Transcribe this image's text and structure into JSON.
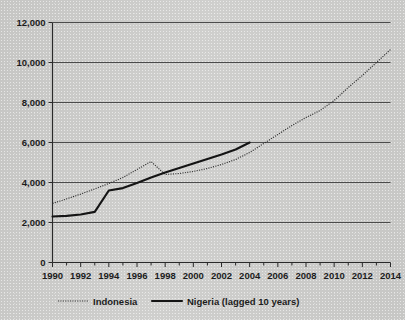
{
  "chart_data": {
    "type": "line",
    "title": "",
    "xlabel": "",
    "ylabel": "",
    "xlim": [
      1990,
      2014
    ],
    "ylim": [
      0,
      12000
    ],
    "grid": true,
    "legend_position": "bottom",
    "y_ticks": [
      "0",
      "2,000",
      "4,000",
      "6,000",
      "8,000",
      "10,000",
      "12,000"
    ],
    "y_tick_values": [
      0,
      2000,
      4000,
      6000,
      8000,
      10000,
      12000
    ],
    "x_ticks": [
      "1990",
      "1992",
      "1994",
      "1996",
      "1998",
      "2000",
      "2002",
      "2004",
      "2006",
      "2008",
      "2010",
      "2012",
      "2014"
    ],
    "x_tick_values": [
      1990,
      1992,
      1994,
      1996,
      1998,
      2000,
      2002,
      2004,
      2006,
      2008,
      2010,
      2012,
      2014
    ],
    "x_minor_ticks": [
      1991,
      1993,
      1995,
      1997,
      1999,
      2001,
      2003,
      2005,
      2007,
      2009,
      2011,
      2013
    ],
    "series": [
      {
        "name": "Indonesia",
        "style": "dotted",
        "color": "#2e2e2e",
        "x": [
          1990,
          1991,
          1992,
          1993,
          1994,
          1995,
          1996,
          1997,
          1998,
          1999,
          2000,
          2001,
          2002,
          2003,
          2004,
          2005,
          2006,
          2007,
          2008,
          2009,
          2010,
          2011,
          2012,
          2013,
          2014
        ],
        "values": [
          2950,
          3180,
          3420,
          3680,
          3950,
          4250,
          4650,
          5050,
          4400,
          4450,
          4550,
          4700,
          4900,
          5150,
          5500,
          5950,
          6400,
          6850,
          7250,
          7600,
          8100,
          8750,
          9350,
          10000,
          10650
        ]
      },
      {
        "name": "Nigeria (lagged 10 years)",
        "style": "solid",
        "color": "#141414",
        "x": [
          1990,
          1991,
          1992,
          1993,
          1994,
          1995,
          1996,
          1997,
          1998,
          1999,
          2000,
          2001,
          2002,
          2003,
          2004
        ],
        "values": [
          2300,
          2330,
          2400,
          2530,
          3600,
          3720,
          3980,
          4250,
          4500,
          4720,
          4950,
          5180,
          5400,
          5650,
          6000
        ]
      }
    ]
  },
  "legend": {
    "items": [
      {
        "label": "Indonesia",
        "style": "dotted"
      },
      {
        "label": "Nigeria (lagged 10 years)",
        "style": "solid"
      }
    ]
  }
}
